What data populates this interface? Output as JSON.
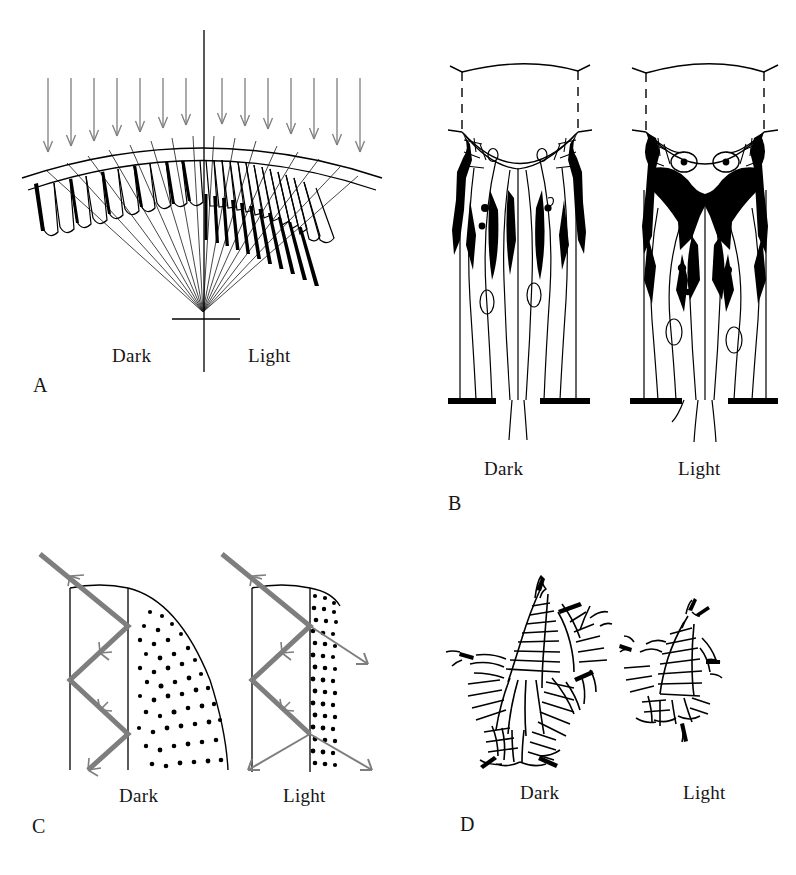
{
  "figure": {
    "type": "scientific-diagram",
    "background_color": "#ffffff",
    "ink_color": "#000000",
    "ray_color": "#7e7e7e"
  },
  "panels": [
    {
      "id": "A",
      "letter": "A",
      "caption_left": "Dark",
      "caption_right": "Light",
      "subject": "superposition eye optics: radial array of ommatidia around a common focal point",
      "left_state": {
        "name": "Dark",
        "cone_type": "short rounded crystalline cones",
        "pigment": "short dark pigment bands confined between cones",
        "optics": "clear zone open, rays converge from many facets"
      },
      "right_state": {
        "name": "Light",
        "cone_type": "elongated crystalline cones",
        "pigment": "long dark pigment sleeves extending down the cone tracts",
        "optics": "clear zone screened, rays restricted"
      },
      "incident_arrows_left": 9,
      "incident_arrows_right": 9,
      "facets_left": 11,
      "facets_right": 11
    },
    {
      "id": "B",
      "letter": "B",
      "caption_left": "Dark",
      "caption_right": "Light",
      "subject": "longitudinal section of a single ommatidium showing screening pigment granule migration",
      "left_state": {
        "name": "Dark",
        "pigment_position": "granules dispersed laterally, distal rhabdom region clear",
        "black_mass": "small, peripheral"
      },
      "right_state": {
        "name": "Light",
        "pigment_position": "granules aggregated centrally around the distal rhabdom",
        "black_mass": "large, central"
      }
    },
    {
      "id": "C",
      "letter": "C",
      "caption_left": "Dark",
      "caption_right": "Light",
      "subject": "light-guide behaviour of the rhabdom with pigment granules near the boundary",
      "left_state": {
        "name": "Dark",
        "granules": "withdrawn from the rhabdom wall",
        "ray_behaviour": "total internal reflection, light guided down the rhabdom",
        "escaping_rays": 0
      },
      "right_state": {
        "name": "Light",
        "granules": "packed against the rhabdom wall",
        "ray_behaviour": "light absorbed and leaked out at each reflection",
        "escaping_rays": 4
      }
    },
    {
      "id": "D",
      "letter": "D",
      "caption_left": "Dark",
      "caption_right": "Light",
      "subject": "transverse section of the rhabdom showing microvillar membrane area",
      "left_state": {
        "name": "Dark",
        "rhabdom_size": "large, star-shaped, expanded microvilli",
        "relative_area": 100
      },
      "right_state": {
        "name": "Light",
        "rhabdom_size": "small, reduced microvillar area",
        "relative_area": 40
      }
    }
  ]
}
